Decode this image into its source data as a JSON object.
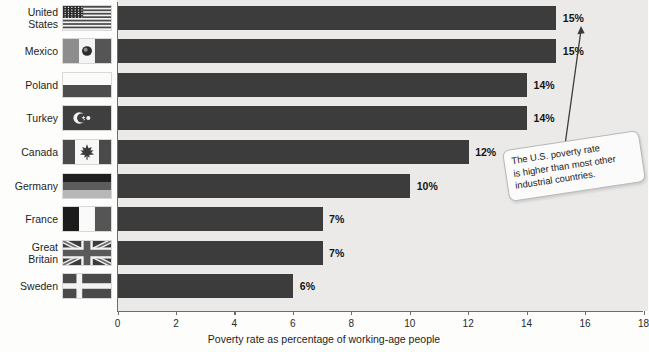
{
  "chart_data": {
    "type": "bar",
    "orientation": "horizontal",
    "title": "",
    "xlabel": "Poverty rate as percentage of working-age people",
    "ylabel": "",
    "xlim": [
      0,
      18
    ],
    "xticks": [
      0,
      2,
      4,
      6,
      8,
      10,
      12,
      14,
      16,
      18
    ],
    "grid": false,
    "legend": null,
    "categories": [
      "United States",
      "Mexico",
      "Poland",
      "Turkey",
      "Canada",
      "Germany",
      "France",
      "Great Britain",
      "Sweden"
    ],
    "values": [
      15,
      15,
      14,
      14,
      12,
      10,
      7,
      7,
      6
    ],
    "value_labels": [
      "15%",
      "15%",
      "14%",
      "14%",
      "12%",
      "10%",
      "7%",
      "7%",
      "6%"
    ],
    "annotations": [
      {
        "text": "The U.S. poverty rate is higher than most other industrial countries.",
        "points_to": "United States"
      }
    ]
  },
  "rows": [
    {
      "label": "United States",
      "label_lines": [
        "United",
        "States"
      ],
      "value": 15,
      "value_label": "15%",
      "flag": "flag-united-states"
    },
    {
      "label": "Mexico",
      "label_lines": [
        "Mexico"
      ],
      "value": 15,
      "value_label": "15%",
      "flag": "flag-mexico"
    },
    {
      "label": "Poland",
      "label_lines": [
        "Poland"
      ],
      "value": 14,
      "value_label": "14%",
      "flag": "flag-poland"
    },
    {
      "label": "Turkey",
      "label_lines": [
        "Turkey"
      ],
      "value": 14,
      "value_label": "14%",
      "flag": "flag-turkey"
    },
    {
      "label": "Canada",
      "label_lines": [
        "Canada"
      ],
      "value": 12,
      "value_label": "12%",
      "flag": "flag-canada"
    },
    {
      "label": "Germany",
      "label_lines": [
        "Germany"
      ],
      "value": 10,
      "value_label": "10%",
      "flag": "flag-germany"
    },
    {
      "label": "France",
      "label_lines": [
        "France"
      ],
      "value": 7,
      "value_label": "7%",
      "flag": "flag-france"
    },
    {
      "label": "Great Britain",
      "label_lines": [
        "Great Britain"
      ],
      "value": 7,
      "value_label": "7%",
      "flag": "flag-great-britain"
    },
    {
      "label": "Sweden",
      "label_lines": [
        "Sweden"
      ],
      "value": 6,
      "value_label": "6%",
      "flag": "flag-sweden"
    }
  ],
  "axis": {
    "label": "Poverty rate as percentage of working-age people",
    "ticks": [
      "0",
      "2",
      "4",
      "6",
      "8",
      "10",
      "12",
      "14",
      "16",
      "18"
    ]
  },
  "callout": {
    "line1": "The U.S. poverty rate",
    "line2": "is higher than most other",
    "line3": "industrial countries.",
    "full": "The U.S. poverty rate is higher than most other industrial countries."
  },
  "colors": {
    "bar": "#3c3c3c",
    "plot_background": "#ebeae8",
    "page_background": "#fdfdfc",
    "axis": "#6d6d6d",
    "text": "#1d1d1d"
  }
}
